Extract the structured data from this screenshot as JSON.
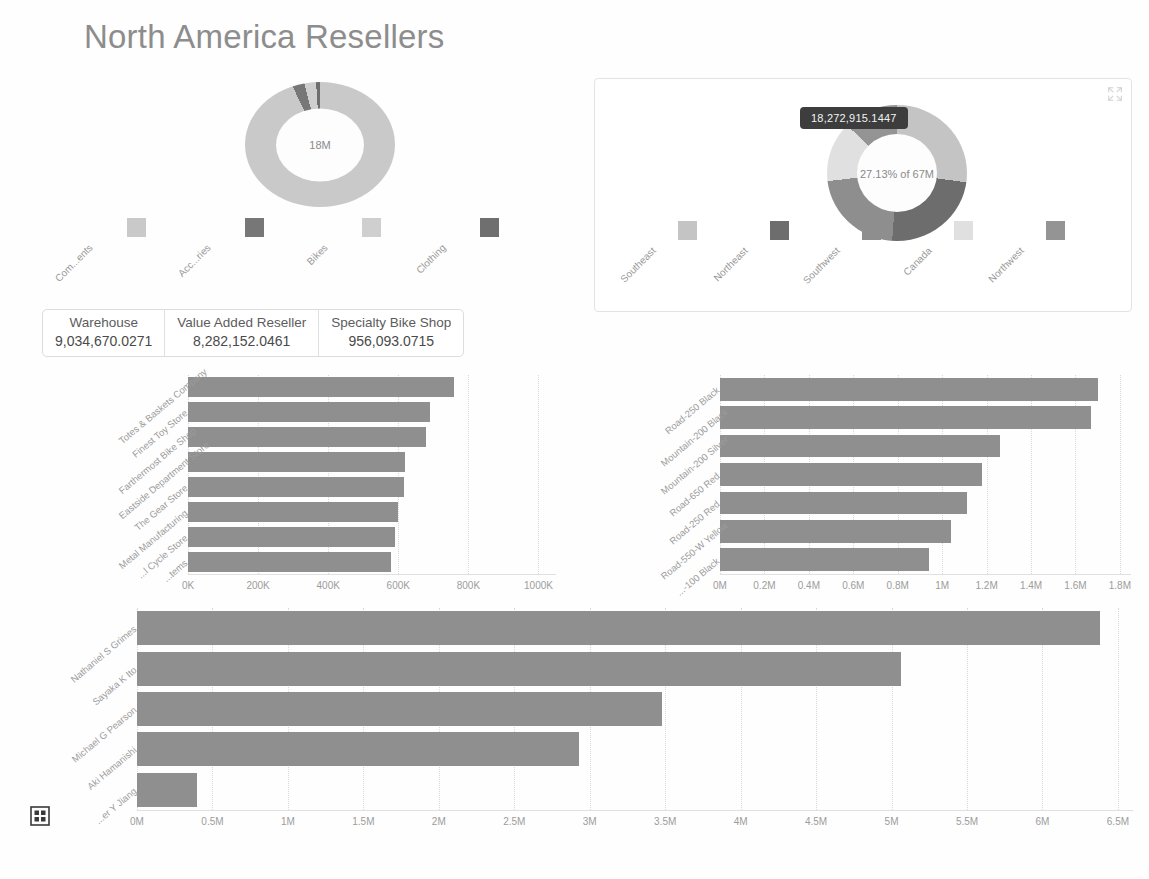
{
  "page": {
    "title": "North America Resellers",
    "background_color": "#fefefe",
    "title_color": "#8d8d8d",
    "bar_color": "#8f8f8f"
  },
  "category_donut": {
    "center_label": "18M",
    "legend": [
      {
        "label": "Com...ents",
        "full_label": "Components",
        "color": "#c9c9c9"
      },
      {
        "label": "Acc...ries",
        "full_label": "Accessories",
        "color": "#777777"
      },
      {
        "label": "Bikes",
        "full_label": "Bikes",
        "color": "#cfcfcf"
      },
      {
        "label": "Clothing",
        "full_label": "Clothing",
        "color": "#6f6f6f"
      }
    ],
    "slices": [
      {
        "name": "Components",
        "color": "#c9c9c9",
        "percent": 93.0
      },
      {
        "name": "Accessories",
        "color": "#777777",
        "percent": 3.0
      },
      {
        "name": "Bikes",
        "color": "#cfcfcf",
        "percent": 3.0
      },
      {
        "name": "Clothing",
        "color": "#6f6f6f",
        "percent": 1.0
      }
    ]
  },
  "region_panel": {
    "focus_icon": "expand-arrows-icon",
    "tooltip": "18,272,915.1447",
    "center_label": "27.13% of 67M",
    "legend": [
      {
        "label": "Southeast",
        "color": "#c4c4c4"
      },
      {
        "label": "Northeast",
        "color": "#6d6d6d"
      },
      {
        "label": "Southwest",
        "color": "#8e8e8e"
      },
      {
        "label": "Canada",
        "color": "#e0e0e0"
      },
      {
        "label": "Northwest",
        "color": "#949494"
      }
    ],
    "slices": [
      {
        "name": "Southeast",
        "color": "#c4c4c4",
        "percent": 27.13
      },
      {
        "name": "Northeast",
        "color": "#6d6d6d",
        "percent": 24.0
      },
      {
        "name": "Southwest",
        "color": "#8e8e8e",
        "percent": 22.0
      },
      {
        "name": "Canada",
        "color": "#e0e0e0",
        "percent": 14.0
      },
      {
        "name": "Northwest",
        "color": "#949494",
        "percent": 12.87
      }
    ]
  },
  "kpi_cards": [
    {
      "title": "Warehouse",
      "value": "9,034,670.0271"
    },
    {
      "title": "Value Added Reseller",
      "value": "8,282,152.0461"
    },
    {
      "title": "Specialty Bike Shop",
      "value": "956,093.0715"
    }
  ],
  "footer": {
    "apps_icon": "grid-apps-icon"
  },
  "chart_data": [
    {
      "id": "resellers_bar",
      "type": "bar",
      "orientation": "horizontal",
      "title": "",
      "xlabel": "",
      "ylabel": "",
      "categories": [
        "Totes & Baskets Company",
        "Finest Toy Store",
        "Farthermost Bike Shop",
        "Eastside Department Store",
        "The Gear Store",
        "Metal Manufacturing",
        "...l Cycle Store",
        "...tems"
      ],
      "values": [
        760000,
        690000,
        680000,
        620000,
        615000,
        600000,
        590000,
        580000
      ],
      "xticks": [
        "0K",
        "200K",
        "400K",
        "600K",
        "800K",
        "1000K"
      ],
      "xtick_values": [
        0,
        200000,
        400000,
        600000,
        800000,
        1000000
      ],
      "xlim": [
        0,
        1050000
      ],
      "grid": true,
      "legend": "none"
    },
    {
      "id": "products_bar",
      "type": "bar",
      "orientation": "horizontal",
      "title": "",
      "xlabel": "",
      "ylabel": "",
      "categories": [
        "Road-250 Black",
        "Mountain-200 Black",
        "Mountain-200 Silver",
        "Road-650 Red",
        "Road-250 Red",
        "Road-550-W Yellow",
        "...-100 Black"
      ],
      "values": [
        1700000,
        1670000,
        1260000,
        1180000,
        1110000,
        1040000,
        940000
      ],
      "xticks": [
        "0M",
        "0.2M",
        "0.4M",
        "0.6M",
        "0.8M",
        "1M",
        "1.2M",
        "1.4M",
        "1.6M",
        "1.8M"
      ],
      "xtick_values": [
        0,
        200000,
        400000,
        600000,
        800000,
        1000000,
        1200000,
        1400000,
        1600000,
        1800000
      ],
      "xlim": [
        0,
        1850000
      ],
      "grid": true,
      "legend": "none"
    },
    {
      "id": "salespeople_bar",
      "type": "bar",
      "orientation": "horizontal",
      "title": "",
      "xlabel": "",
      "ylabel": "",
      "categories": [
        "Nathaniel S Grimes",
        "Sayaka K Ito",
        "Michael G Pearson",
        "Aki Hamanishi",
        "...er Y Jiang"
      ],
      "values": [
        6380000,
        5060000,
        3480000,
        2930000,
        400000
      ],
      "xticks": [
        "0M",
        "0.5M",
        "1M",
        "1.5M",
        "2M",
        "2.5M",
        "3M",
        "3.5M",
        "4M",
        "4.5M",
        "5M",
        "5.5M",
        "6M",
        "6.5M"
      ],
      "xtick_values": [
        0,
        500000,
        1000000,
        1500000,
        2000000,
        2500000,
        3000000,
        3500000,
        4000000,
        4500000,
        5000000,
        5500000,
        6000000,
        6500000
      ],
      "xlim": [
        0,
        6600000
      ],
      "grid": true,
      "legend": "none"
    }
  ]
}
